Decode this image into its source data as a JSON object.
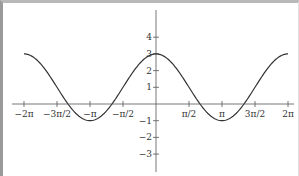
{
  "chart_data": {
    "type": "line",
    "title": "",
    "xlabel": "",
    "ylabel": "",
    "function": "y = 1 + 2cos(x)",
    "xlim": [
      -6.2832,
      6.2832
    ],
    "ylim": [
      -3.3,
      4.2
    ],
    "grid": false,
    "legend": null,
    "x_ticks": [
      {
        "value": -6.2832,
        "label": "−2π"
      },
      {
        "value": -4.7124,
        "label": "−3π/2"
      },
      {
        "value": -3.1416,
        "label": "−π"
      },
      {
        "value": -1.5708,
        "label": "−π/2"
      },
      {
        "value": 1.5708,
        "label": "π/2"
      },
      {
        "value": 3.1416,
        "label": "π"
      },
      {
        "value": 4.7124,
        "label": "3π/2"
      },
      {
        "value": 6.2832,
        "label": "2π"
      }
    ],
    "y_ticks": [
      {
        "value": 4,
        "label": "4"
      },
      {
        "value": 3,
        "label": "3"
      },
      {
        "value": 2,
        "label": "2"
      },
      {
        "value": 1,
        "label": "1"
      },
      {
        "value": -1,
        "label": "−1"
      },
      {
        "value": -2,
        "label": "−2"
      },
      {
        "value": -3,
        "label": "−3"
      }
    ],
    "series": [
      {
        "name": "f(x)",
        "x": [
          -6.2832,
          -5.4978,
          -4.7124,
          -3.927,
          -3.1416,
          -2.3562,
          -1.5708,
          -0.7854,
          0,
          0.7854,
          1.5708,
          2.3562,
          3.1416,
          3.927,
          4.7124,
          5.4978,
          6.2832
        ],
        "y": [
          3,
          2.414,
          1,
          -0.414,
          -1,
          -0.414,
          1,
          2.414,
          3,
          2.414,
          1,
          -0.414,
          -1,
          -0.414,
          1,
          2.414,
          3
        ]
      }
    ],
    "colors": {
      "curve": "#333333",
      "axis": "#555555",
      "frame": "#a0a0a0"
    }
  }
}
